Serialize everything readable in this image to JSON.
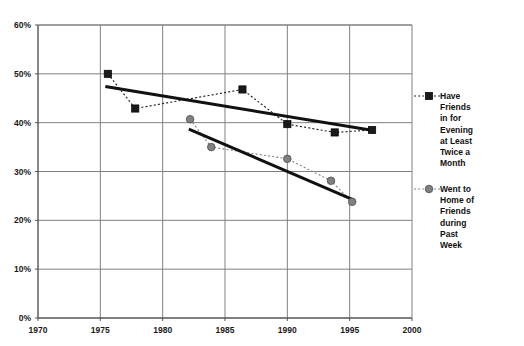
{
  "chart_data": {
    "type": "line",
    "title": "",
    "subtitle": "",
    "xlabel": "",
    "ylabel": "",
    "xlim": [
      1970,
      2000
    ],
    "ylim": [
      0,
      60
    ],
    "grid": true,
    "legend_position": "right",
    "x_ticks": [
      "1970",
      "1975",
      "1980",
      "1985",
      "1990",
      "1995",
      "2000"
    ],
    "x_tick_values": [
      1970,
      1975,
      1980,
      1985,
      1990,
      1995,
      2000
    ],
    "y_ticks": [
      "0%",
      "10%",
      "20%",
      "30%",
      "40%",
      "50%",
      "60%"
    ],
    "y_tick_values": [
      0,
      10,
      20,
      30,
      40,
      50,
      60
    ],
    "series": [
      {
        "name": "Have Friends in for Evening at Least Twice a Month",
        "marker": "square",
        "color": "#1a1a1a",
        "linestyle": "dotted",
        "x": [
          1975.6,
          1977.8,
          1986.4,
          1990.0,
          1993.8,
          1996.8
        ],
        "values": [
          50.0,
          42.9,
          46.8,
          39.7,
          38.0,
          38.5
        ],
        "trend": {
          "linestyle": "solid",
          "x": [
            1975.4,
            1996.9
          ],
          "values": [
            47.4,
            38.4
          ]
        }
      },
      {
        "name": "Went to Home of Friends during Past Week",
        "marker": "circle",
        "color": "#808080",
        "linestyle": "dotted",
        "x": [
          1982.2,
          1983.9,
          1990.0,
          1993.5,
          1995.2
        ],
        "values": [
          40.7,
          35.0,
          32.6,
          28.1,
          23.8
        ],
        "trend": {
          "linestyle": "solid",
          "x": [
            1982.1,
            1995.3
          ],
          "values": [
            38.7,
            24.2
          ]
        }
      }
    ]
  },
  "legend": {
    "entries": [
      {
        "marker": "square",
        "lines": [
          "Have",
          "Friends",
          "in for",
          "Evening",
          "at Least",
          "Twice a",
          "Month"
        ]
      },
      {
        "marker": "circle",
        "lines": [
          "Went to",
          "Home of",
          "Friends",
          "during",
          "Past",
          "Week"
        ]
      }
    ]
  }
}
